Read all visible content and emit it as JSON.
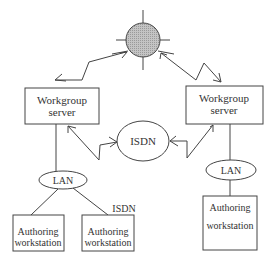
{
  "diagram": {
    "colors": {
      "stroke": "#444444",
      "globe_fill": "#b8b8b8",
      "background": "#ffffff",
      "text": "#333333"
    },
    "globe": {
      "icon": "network-globe-icon",
      "cx": 143,
      "cy": 40,
      "r": 17
    },
    "nodes": {
      "left_server": {
        "line1": "Workgroup",
        "line2": "server"
      },
      "right_server": {
        "line1": "Workgroup",
        "line2": "server"
      },
      "isdn_hub": {
        "label": "ISDN"
      },
      "left_lan": {
        "label": "LAN"
      },
      "right_lan": {
        "label": "LAN"
      },
      "left_ws1": {
        "line1": "Authoring",
        "line2": "workstation"
      },
      "left_ws2": {
        "line1": "Authoring",
        "line2": "workstation"
      },
      "right_ws": {
        "line1": "Authoring",
        "line2": "workstation"
      }
    },
    "annotations": {
      "isdn_label": "ISDN"
    },
    "links": [
      {
        "from": "globe",
        "to": "left_server",
        "type": "lightning-bidirectional"
      },
      {
        "from": "globe",
        "to": "right_server",
        "type": "lightning-bidirectional"
      },
      {
        "from": "left_server",
        "to": "isdn_hub",
        "type": "lightning-bidirectional"
      },
      {
        "from": "right_server",
        "to": "isdn_hub",
        "type": "lightning-bidirectional"
      },
      {
        "from": "left_server",
        "to": "left_lan",
        "type": "line"
      },
      {
        "from": "right_server",
        "to": "right_lan",
        "type": "line"
      },
      {
        "from": "left_lan",
        "to": "left_ws1",
        "type": "line"
      },
      {
        "from": "left_lan",
        "to": "left_ws2",
        "type": "line"
      },
      {
        "from": "right_lan",
        "to": "right_ws",
        "type": "line"
      }
    ]
  }
}
